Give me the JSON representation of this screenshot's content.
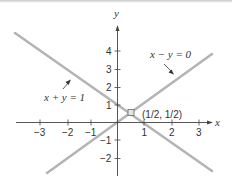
{
  "diagram": {
    "axes": {
      "x_label": "x",
      "y_label": "y",
      "x_ticks": [
        {
          "value": -3,
          "label": "−3"
        },
        {
          "value": -2,
          "label": "−2"
        },
        {
          "value": -1,
          "label": "−1"
        },
        {
          "value": 1,
          "label": "1"
        },
        {
          "value": 2,
          "label": "2"
        },
        {
          "value": 3,
          "label": "3"
        }
      ],
      "y_ticks": [
        {
          "value": 4,
          "label": "4"
        },
        {
          "value": 3,
          "label": "3"
        },
        {
          "value": 2,
          "label": "2"
        },
        {
          "value": 1,
          "label": "1"
        },
        {
          "value": -1,
          "label": "−1"
        },
        {
          "value": -2,
          "label": "−2"
        }
      ]
    },
    "lines": [
      {
        "equation": "x + y = 1",
        "color": "#b0b0b0"
      },
      {
        "equation": "x − y = 0",
        "color": "#b0b0b0"
      }
    ],
    "intersection": {
      "label": "(1/2, 1/2)",
      "color": "#999999"
    }
  }
}
